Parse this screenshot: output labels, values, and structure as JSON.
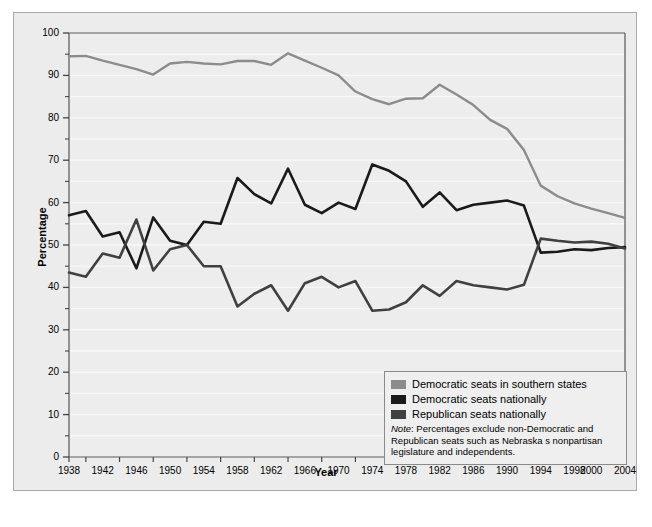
{
  "figure": {
    "background": "#ffffff",
    "panel_background": "#ececec",
    "plot_background": "#ededed",
    "border_color": "#a9a9a9",
    "gridline_color": "#f7f7f7"
  },
  "axes": {
    "ylabel": "Percentage",
    "xlabel": "Year",
    "ytick_labels": [
      "0",
      "10",
      "20",
      "30",
      "40",
      "50",
      "60",
      "70",
      "80",
      "90",
      "100"
    ],
    "xtick_labels": [
      "1938",
      "1942",
      "1946",
      "1950",
      "1954",
      "1958",
      "1962",
      "1966",
      "1970",
      "1974",
      "1978",
      "1982",
      "1986",
      "1990",
      "1994",
      "1998",
      "2000",
      "2004"
    ]
  },
  "legend": {
    "items": [
      {
        "label": "Democratic seats in southern states",
        "color": "#8c8c8c",
        "swatch_name": "legend-swatch-southern"
      },
      {
        "label": "Democratic seats nationally",
        "color": "#1a1a1a",
        "swatch_name": "legend-swatch-democratic"
      },
      {
        "label": "Republican seats nationally",
        "color": "#404040",
        "swatch_name": "legend-swatch-republican"
      }
    ],
    "note_word": "Note",
    "note_text": ": Percentages exclude non-Democratic and Republican seats such as Nebraska s nonpartisan legislature and independents."
  },
  "chart_data": {
    "type": "line",
    "title": "",
    "xlabel": "Year",
    "ylabel": "Percentage",
    "xlim": [
      1938,
      2004
    ],
    "ylim": [
      0,
      100
    ],
    "grid": true,
    "legend_position": "lower-right",
    "x": [
      1938,
      1940,
      1942,
      1944,
      1946,
      1948,
      1950,
      1952,
      1954,
      1956,
      1958,
      1960,
      1962,
      1964,
      1966,
      1968,
      1970,
      1972,
      1974,
      1976,
      1978,
      1980,
      1982,
      1984,
      1986,
      1988,
      1990,
      1992,
      1994,
      1996,
      1998,
      2000,
      2002,
      2004
    ],
    "series": [
      {
        "name": "Democratic seats in southern states",
        "color": "#8c8c8c",
        "values": [
          94.5,
          94.6,
          93.5,
          92.5,
          91.5,
          90.2,
          92.8,
          93.2,
          92.8,
          92.6,
          93.4,
          93.4,
          92.5,
          95.2,
          93.5,
          91.8,
          90.0,
          86.2,
          84.4,
          83.2,
          84.5,
          84.6,
          87.8,
          85.5,
          83.0,
          79.5,
          77.4,
          72.4,
          64.0,
          61.5,
          59.8,
          58.6,
          57.5,
          56.4
        ]
      },
      {
        "name": "Democratic seats nationally",
        "color": "#1a1a1a",
        "values": [
          57.0,
          58.0,
          52.0,
          53.0,
          44.5,
          56.5,
          51.0,
          50.0,
          55.5,
          55.0,
          65.8,
          62.0,
          59.8,
          68.0,
          59.5,
          57.5,
          60.0,
          58.5,
          69.0,
          67.5,
          65.0,
          59.0,
          62.4,
          58.2,
          59.5,
          60.0,
          60.5,
          59.3,
          48.2,
          48.4,
          49.0,
          48.8,
          49.3,
          49.5
        ]
      },
      {
        "name": "Republican seats nationally",
        "color": "#404040",
        "values": [
          43.5,
          42.5,
          48.0,
          47.0,
          56.0,
          44.0,
          49.0,
          50.0,
          45.0,
          45.0,
          35.5,
          38.5,
          40.5,
          34.5,
          41.0,
          42.5,
          40.0,
          41.5,
          34.5,
          34.8,
          36.5,
          40.5,
          38.0,
          41.5,
          40.5,
          40.0,
          39.5,
          40.6,
          51.5,
          51.0,
          50.6,
          50.8,
          50.3,
          49.2
        ]
      }
    ]
  }
}
